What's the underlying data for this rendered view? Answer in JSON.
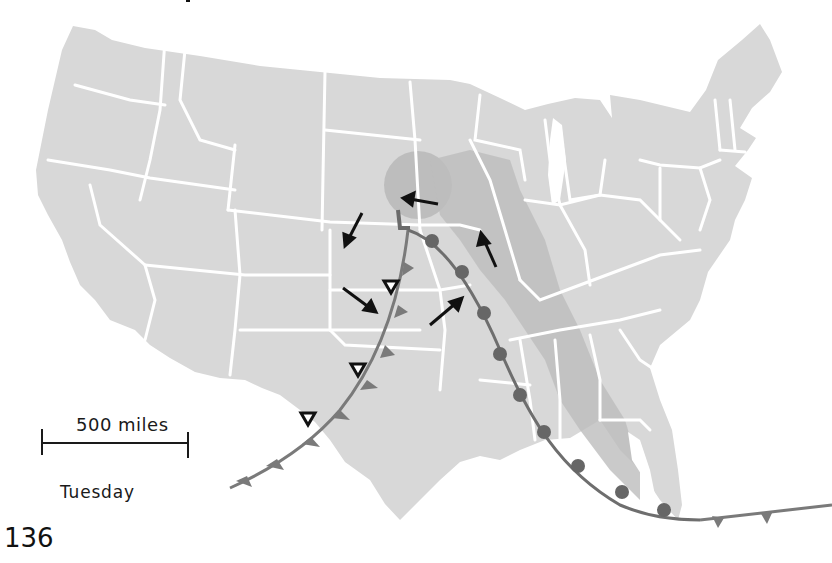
{
  "map": {
    "subject": "United States weather map",
    "scale": {
      "label": "500 miles"
    },
    "day_label": "Tuesday",
    "page_number": "136",
    "pressure_center": {
      "symbol": "L",
      "type": "low pressure"
    },
    "fronts": [
      {
        "type": "cold front",
        "symbol": "triangles"
      },
      {
        "type": "warm front",
        "symbol": "semicircles"
      }
    ],
    "precipitation_symbols": {
      "type": "open triangle",
      "count": 4
    },
    "wind_arrows": {
      "count": 7
    },
    "colors": {
      "land": "#d9d9d9",
      "shaded_region": "#b8b8b8",
      "state_borders": "#ffffff",
      "fronts": "#7a7a7a",
      "arrows": "#111111"
    }
  }
}
